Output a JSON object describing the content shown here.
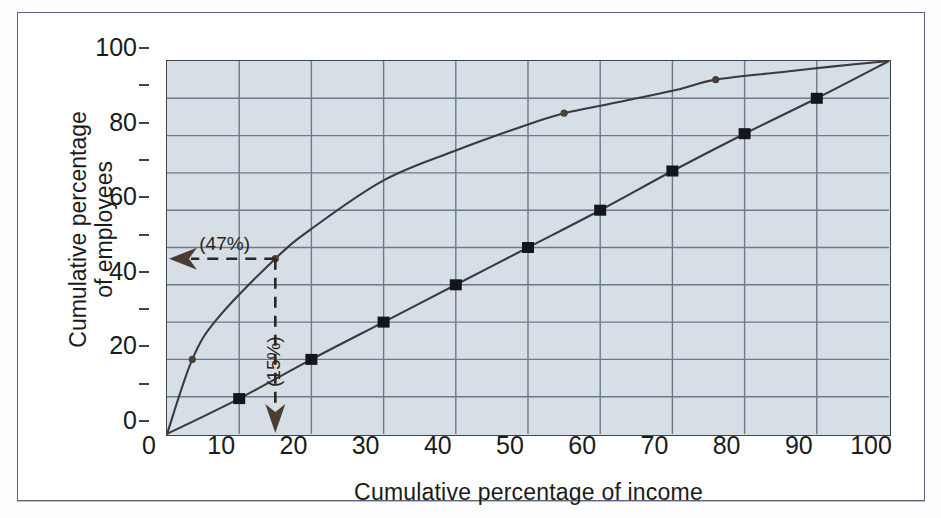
{
  "figure": {
    "axis_titles": {
      "x": "Cumulative percentage of income",
      "y_line1": "Cumulative percentage",
      "y_line2": "of employees"
    },
    "annotations": {
      "horizontal_label": "(47%)",
      "vertical_label": "(15%)"
    },
    "colors": {
      "plot_background": "#d6dee6",
      "gridline": "#6d7a8a",
      "axis_frame": "#3c4450",
      "curve": "#3a3a42",
      "marker": "#15151c",
      "annotation": "#2b2620",
      "page_border": "#5a6480"
    }
  },
  "chart_data": {
    "type": "line",
    "title": "",
    "xlabel": "Cumulative percentage of income",
    "ylabel": "Cumulative percentage of employees",
    "xlim": [
      0,
      100
    ],
    "ylim": [
      0,
      100
    ],
    "xticks": [
      0,
      10,
      20,
      30,
      40,
      50,
      60,
      70,
      80,
      90,
      100
    ],
    "yticks": [
      0,
      20,
      40,
      60,
      80,
      100
    ],
    "minor_yticks": [
      10,
      30,
      50,
      70,
      90
    ],
    "grid": true,
    "legend": "none",
    "series": [
      {
        "name": "Lorenz curve",
        "marker": "circle",
        "x": [
          0,
          3.5,
          7,
          15,
          20,
          30,
          40,
          50,
          55,
          60,
          70,
          76,
          85,
          92,
          100
        ],
        "y": [
          0,
          20,
          31,
          47,
          55,
          68,
          76,
          83,
          86,
          88,
          92,
          95,
          97,
          98.5,
          100
        ],
        "marker_points": [
          {
            "x": 3.5,
            "y": 20
          },
          {
            "x": 15,
            "y": 47
          },
          {
            "x": 55,
            "y": 86
          },
          {
            "x": 76,
            "y": 95
          }
        ]
      },
      {
        "name": "Line of equality",
        "marker": "square",
        "x": [
          0,
          10,
          20,
          30,
          40,
          50,
          60,
          70,
          80,
          90,
          100
        ],
        "y": [
          0,
          9.5,
          20,
          30,
          40,
          50,
          60,
          70.5,
          80.5,
          90,
          100
        ],
        "marker_points": [
          {
            "x": 10,
            "y": 9.5
          },
          {
            "x": 20,
            "y": 20
          },
          {
            "x": 30,
            "y": 30
          },
          {
            "x": 40,
            "y": 40
          },
          {
            "x": 50,
            "y": 50
          },
          {
            "x": 60,
            "y": 60
          },
          {
            "x": 70,
            "y": 70.5
          },
          {
            "x": 80,
            "y": 80.5
          },
          {
            "x": 90,
            "y": 90
          }
        ]
      }
    ],
    "annotations": [
      {
        "label": "(47%)",
        "type": "arrow-left",
        "from": {
          "x": 15,
          "y": 47
        },
        "to": {
          "x": 0,
          "y": 47
        }
      },
      {
        "label": "(15%)",
        "type": "arrow-down",
        "from": {
          "x": 15,
          "y": 47
        },
        "to": {
          "x": 15,
          "y": 0
        }
      }
    ]
  },
  "ticks": {
    "x": [
      "0",
      "10",
      "20",
      "30",
      "40",
      "50",
      "60",
      "70",
      "80",
      "90",
      "100"
    ],
    "y": [
      "0",
      "20",
      "40",
      "60",
      "80",
      "100"
    ]
  }
}
